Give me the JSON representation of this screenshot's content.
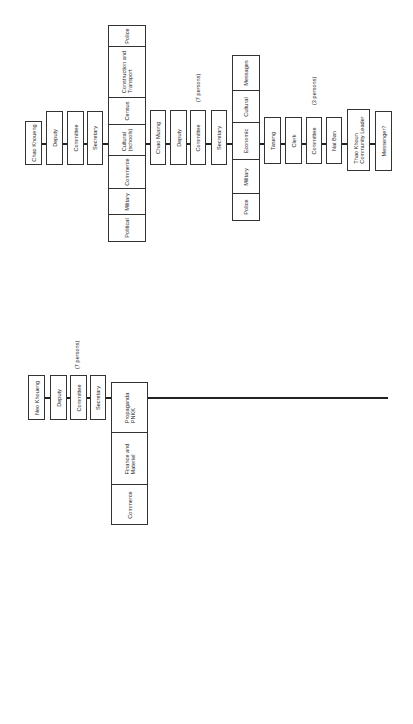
{
  "diagrams": [
    {
      "name": "province-district-org-chart",
      "chain_top": [
        "Chao Khoueng",
        "Deputy",
        "Committee",
        "Secretary"
      ],
      "sections_1": [
        "Political",
        "Military",
        "Commerce",
        "Cultural\n(schools)",
        "Census",
        "Construction and\nTransport",
        "Police"
      ],
      "chain_mid": [
        "Chao Muong",
        "Deputy",
        "Committee",
        "Secretary"
      ],
      "mid_note": "(7 persons)",
      "sections_2": [
        "Police",
        "Military",
        "Economic",
        "Cultural",
        "Messages"
      ],
      "chain_bottom": [
        "Taseng",
        "Clerk",
        "Committee",
        "Nai Ban",
        "Thao Khoun\nCommunity Leader",
        "Messenger?"
      ],
      "bottom_note": "(3 persons)"
    },
    {
      "name": "neo-front-org-chart",
      "chain_top": [
        "Neo Khoueng",
        "Deputy",
        "Committee",
        "Secretary"
      ],
      "top_note": "(7 persons)",
      "sections_1": [
        "Commerce",
        "Finance and\nMateriel",
        "Propaganda\nPNKK",
        "Personnel",
        "Communication,\nTelegraph,\nMessage",
        "Other\nSections"
      ],
      "chain_mid": [
        "Neo Muong",
        "Deputy",
        "Committee",
        "Secretary"
      ],
      "sections_2": [
        "Commerce",
        "Finance and\nMateriel",
        "Propaganda\nPNKK",
        "Personnel",
        "Messages"
      ],
      "chain_bottom": [
        "Neo Taseng",
        "Deputy",
        "Committee",
        "Neo Ban",
        "Deputy",
        "Committee"
      ],
      "bottom_note": "(3 persons)"
    }
  ]
}
